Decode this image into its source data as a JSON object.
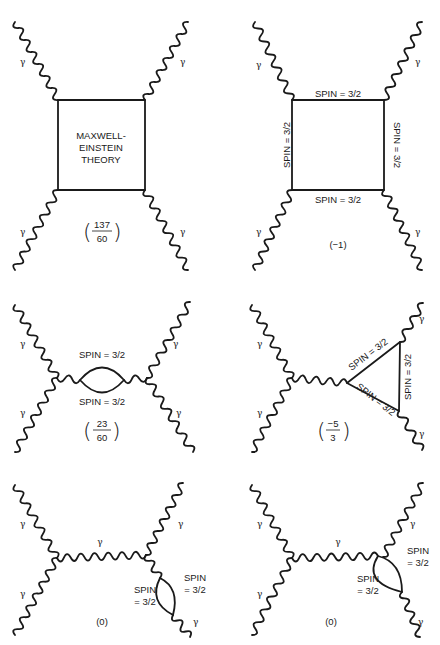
{
  "figure": {
    "width": 440,
    "height": 645,
    "colors": {
      "ink": "#1a1a1a",
      "background": "#ffffff"
    }
  },
  "labels": {
    "gamma": "γ",
    "spin": "SPIN = 3/2",
    "spin_line1": "SPIN",
    "spin_line2": "= 3/2",
    "box_line1": "MAXWELL-",
    "box_line2": "EINSTEIN",
    "box_line3": "THEORY"
  },
  "diagrams": [
    {
      "id": "a",
      "name": "maxwell-einstein-box",
      "coefficient": {
        "type": "fraction",
        "numerator": "137",
        "denominator": "60"
      }
    },
    {
      "id": "b",
      "name": "spin-3-2-box",
      "coefficient": {
        "type": "plain",
        "text": "(−1)"
      }
    },
    {
      "id": "c",
      "name": "spin-3-2-bubble",
      "coefficient": {
        "type": "fraction",
        "numerator": "23",
        "denominator": "60"
      }
    },
    {
      "id": "d",
      "name": "spin-3-2-triangle",
      "coefficient": {
        "type": "fraction",
        "numerator": "−5",
        "denominator": "3"
      }
    },
    {
      "id": "e",
      "name": "tadpole-bubble-left",
      "coefficient": {
        "type": "plain",
        "text": "(0)"
      }
    },
    {
      "id": "f",
      "name": "tadpole-bubble-right",
      "coefficient": {
        "type": "plain",
        "text": "(0)"
      }
    }
  ],
  "wavy_lines": [
    {
      "x1": 15,
      "y1": 22,
      "x2": 58,
      "y2": 100
    },
    {
      "x1": 188,
      "y1": 22,
      "x2": 145,
      "y2": 100
    },
    {
      "x1": 58,
      "y1": 190,
      "x2": 15,
      "y2": 270
    },
    {
      "x1": 145,
      "y1": 190,
      "x2": 188,
      "y2": 270
    },
    {
      "x1": 255,
      "y1": 22,
      "x2": 292,
      "y2": 100
    },
    {
      "x1": 422,
      "y1": 22,
      "x2": 384,
      "y2": 100
    },
    {
      "x1": 292,
      "y1": 190,
      "x2": 255,
      "y2": 270
    },
    {
      "x1": 384,
      "y1": 190,
      "x2": 422,
      "y2": 270
    },
    {
      "x1": 15,
      "y1": 305,
      "x2": 57,
      "y2": 378
    },
    {
      "x1": 57,
      "y1": 378,
      "x2": 15,
      "y2": 452
    },
    {
      "x1": 190,
      "y1": 302,
      "x2": 147,
      "y2": 378
    },
    {
      "x1": 147,
      "y1": 378,
      "x2": 193,
      "y2": 452
    },
    {
      "x1": 57,
      "y1": 378,
      "x2": 80,
      "y2": 380
    },
    {
      "x1": 124,
      "y1": 380,
      "x2": 147,
      "y2": 378
    },
    {
      "x1": 252,
      "y1": 305,
      "x2": 292,
      "y2": 378
    },
    {
      "x1": 292,
      "y1": 378,
      "x2": 252,
      "y2": 452
    },
    {
      "x1": 292,
      "y1": 378,
      "x2": 347,
      "y2": 383
    },
    {
      "x1": 423,
      "y1": 303,
      "x2": 400,
      "y2": 342
    },
    {
      "x1": 399,
      "y1": 411,
      "x2": 422,
      "y2": 450
    },
    {
      "x1": 15,
      "y1": 485,
      "x2": 57,
      "y2": 558
    },
    {
      "x1": 57,
      "y1": 558,
      "x2": 15,
      "y2": 635
    },
    {
      "x1": 57,
      "y1": 558,
      "x2": 146,
      "y2": 555
    },
    {
      "x1": 183,
      "y1": 483,
      "x2": 146,
      "y2": 555
    },
    {
      "x1": 146,
      "y1": 555,
      "x2": 160,
      "y2": 578
    },
    {
      "x1": 173,
      "y1": 615,
      "x2": 190,
      "y2": 637
    },
    {
      "x1": 252,
      "y1": 485,
      "x2": 292,
      "y2": 558
    },
    {
      "x1": 292,
      "y1": 558,
      "x2": 252,
      "y2": 635
    },
    {
      "x1": 292,
      "y1": 558,
      "x2": 378,
      "y2": 556
    },
    {
      "x1": 423,
      "y1": 483,
      "x2": 383,
      "y2": 557
    },
    {
      "x1": 402,
      "y1": 592,
      "x2": 420,
      "y2": 637
    }
  ],
  "texts": [
    {
      "key": "gamma",
      "x": 20,
      "y": 65,
      "cls": "gamma"
    },
    {
      "key": "gamma",
      "x": 180,
      "y": 65,
      "cls": "gamma"
    },
    {
      "key": "gamma",
      "x": 20,
      "y": 235,
      "cls": "gamma"
    },
    {
      "key": "gamma",
      "x": 180,
      "y": 235,
      "cls": "gamma"
    },
    {
      "key": "box_line1",
      "x": 101,
      "y": 139,
      "cls": "lbl",
      "anchor": "middle"
    },
    {
      "key": "box_line2",
      "x": 101,
      "y": 151,
      "cls": "lbl",
      "anchor": "middle"
    },
    {
      "key": "box_line3",
      "x": 101,
      "y": 163,
      "cls": "lbl",
      "anchor": "middle"
    },
    {
      "key": "gamma",
      "x": 256,
      "y": 68,
      "cls": "gamma"
    },
    {
      "key": "gamma",
      "x": 415,
      "y": 65,
      "cls": "gamma"
    },
    {
      "key": "gamma",
      "x": 256,
      "y": 235,
      "cls": "gamma"
    },
    {
      "key": "gamma",
      "x": 415,
      "y": 235,
      "cls": "gamma"
    },
    {
      "key": "spin",
      "x": 338,
      "y": 97,
      "cls": "lbl",
      "anchor": "middle"
    },
    {
      "key": "spin",
      "x": 338,
      "y": 203,
      "cls": "lbl",
      "anchor": "middle"
    },
    {
      "key": "gamma",
      "x": 20,
      "y": 347,
      "cls": "gamma"
    },
    {
      "key": "gamma",
      "x": 20,
      "y": 416,
      "cls": "gamma"
    },
    {
      "key": "gamma",
      "x": 173,
      "y": 347,
      "cls": "gamma"
    },
    {
      "key": "gamma",
      "x": 176,
      "y": 416,
      "cls": "gamma"
    },
    {
      "key": "spin",
      "x": 102,
      "y": 358,
      "cls": "lbl",
      "anchor": "middle"
    },
    {
      "key": "spin",
      "x": 102,
      "y": 405,
      "cls": "lbl",
      "anchor": "middle"
    },
    {
      "key": "gamma",
      "x": 257,
      "y": 347,
      "cls": "gamma"
    },
    {
      "key": "gamma",
      "x": 257,
      "y": 416,
      "cls": "gamma"
    },
    {
      "key": "gamma",
      "x": 419,
      "y": 322,
      "cls": "gamma"
    },
    {
      "key": "gamma",
      "x": 419,
      "y": 437,
      "cls": "gamma"
    },
    {
      "key": "gamma",
      "x": 20,
      "y": 527,
      "cls": "gamma"
    },
    {
      "key": "gamma",
      "x": 20,
      "y": 597,
      "cls": "gamma"
    },
    {
      "key": "gamma",
      "x": 100,
      "y": 545,
      "cls": "gamma",
      "anchor": "middle"
    },
    {
      "key": "gamma",
      "x": 178,
      "y": 527,
      "cls": "gamma"
    },
    {
      "key": "gamma",
      "x": 193,
      "y": 625,
      "cls": "gamma"
    },
    {
      "key": "spin_line1",
      "x": 195,
      "y": 581,
      "cls": "lbl",
      "anchor": "middle"
    },
    {
      "key": "spin_line2",
      "x": 195,
      "y": 593,
      "cls": "lbl",
      "anchor": "middle"
    },
    {
      "key": "spin_line1",
      "x": 145,
      "y": 593,
      "cls": "lbl",
      "anchor": "middle"
    },
    {
      "key": "spin_line2",
      "x": 145,
      "y": 605,
      "cls": "lbl",
      "anchor": "middle"
    },
    {
      "key": "gamma",
      "x": 257,
      "y": 527,
      "cls": "gamma"
    },
    {
      "key": "gamma",
      "x": 257,
      "y": 597,
      "cls": "gamma"
    },
    {
      "key": "gamma",
      "x": 338,
      "y": 545,
      "cls": "gamma",
      "anchor": "middle"
    },
    {
      "key": "gamma",
      "x": 410,
      "y": 527,
      "cls": "gamma"
    },
    {
      "key": "gamma",
      "x": 418,
      "y": 625,
      "cls": "gamma"
    },
    {
      "key": "spin_line1",
      "x": 418,
      "y": 554,
      "cls": "lbl",
      "anchor": "middle"
    },
    {
      "key": "spin_line2",
      "x": 418,
      "y": 566,
      "cls": "lbl",
      "anchor": "middle"
    },
    {
      "key": "spin_line1",
      "x": 368,
      "y": 582,
      "cls": "lbl",
      "anchor": "middle"
    },
    {
      "key": "spin_line2",
      "x": 368,
      "y": 594,
      "cls": "lbl",
      "anchor": "middle"
    }
  ]
}
